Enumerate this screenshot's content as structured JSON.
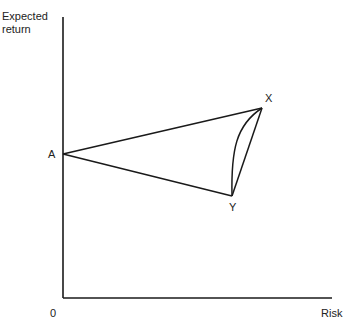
{
  "diagram": {
    "y_axis_label_line1": "Expected",
    "y_axis_label_line2": "return",
    "x_axis_label": "Risk",
    "origin_label": "0",
    "points": {
      "A": {
        "label": "A"
      },
      "X": {
        "label": "X"
      },
      "Y": {
        "label": "Y"
      }
    },
    "line_color": "#1a1a1a"
  }
}
